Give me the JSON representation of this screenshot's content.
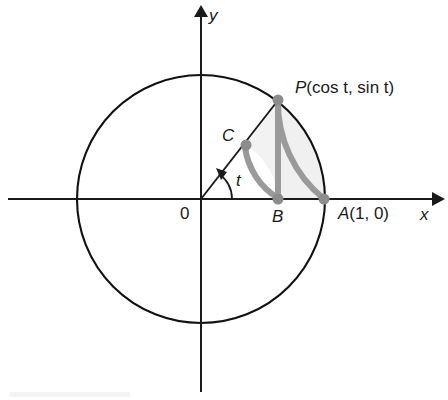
{
  "figure": {
    "background_color": "#ffffff",
    "axes": {
      "x_axis_label": "x",
      "y_axis_label": "y",
      "origin_label": "0",
      "x_axis_color": "#1a1a1a",
      "y_axis_color": "#1a1a1a"
    },
    "circle": {
      "name": "unit-circle",
      "center_label": "0",
      "stroke_color": "#111111",
      "radius_px": 124,
      "center_px": [
        201,
        199
      ]
    },
    "points": [
      {
        "id": "P",
        "label": "P(cos t, sin t)",
        "label_text_plain": "P(cos t, sin t)",
        "x_px": 278,
        "y_px": 100
      },
      {
        "id": "C",
        "label": "C",
        "x_px": 246,
        "y_px": 145
      },
      {
        "id": "B",
        "label": "B",
        "x_px": 278,
        "y_px": 199
      },
      {
        "id": "A",
        "label": "A(1, 0)",
        "x_px": 324,
        "y_px": 199
      }
    ],
    "angle": {
      "label": "t",
      "value_degrees": 52,
      "vertex_label": "0"
    },
    "accent": {
      "stroke_color": "#9a9a9a",
      "fill_color": "#f0f0f0",
      "stroke_width": 6,
      "elements": [
        "arc-P-to-A",
        "segment-P-to-B",
        "arc-C-to-B"
      ]
    },
    "point_marker_color": "#8c8c8c",
    "labels": {
      "P": "P",
      "P_args": "(cos t, sin t)",
      "P_full": "P(cos t, sin t)",
      "A": "A",
      "A_args": "(1, 0)",
      "A_full": "A(1, 0)",
      "B": "B",
      "C": "C",
      "t": "t",
      "origin": "0",
      "x": "x",
      "y": "y"
    }
  }
}
